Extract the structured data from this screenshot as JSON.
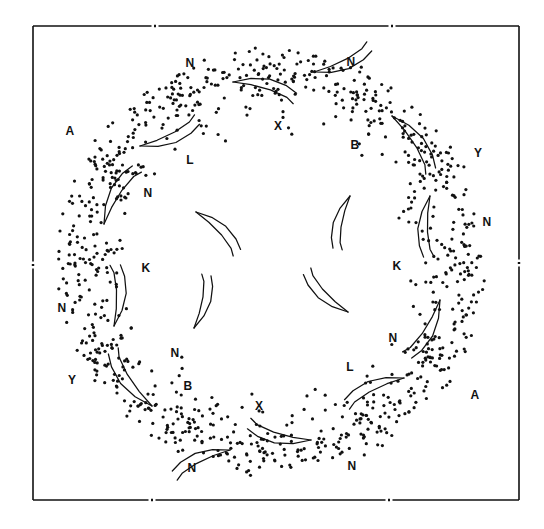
{
  "figure": {
    "domain": "point-pattern-scatter-figure",
    "background_color": "#ffffff",
    "ink_color": "#111111",
    "point_color": "#111111",
    "point_radius_px": 1.6,
    "symmetry": "2-fold rotational (180 degrees) about the ring centre",
    "ring": {
      "center_x": 272,
      "center_y": 262,
      "inner_radius": 100,
      "outer_radius": 215,
      "cluster_count": 12
    }
  },
  "frame": {
    "name": "axis-frame",
    "left": 33,
    "top": 26,
    "right": 519,
    "bottom": 500,
    "stroke_color": "#111111",
    "stroke_width": 1.6,
    "tick_style": "broken-gap tick marks at segment midpoints",
    "ticks": {
      "top": [
        155,
        392
      ],
      "bottom": [
        152,
        389
      ],
      "left": [
        265
      ],
      "right": [
        263
      ]
    },
    "tick_gap_px": 7
  },
  "labels": [
    {
      "id": "lbl-N-top",
      "text": "N",
      "x": 190,
      "y": 63
    },
    {
      "id": "lbl-N-topright",
      "text": "N",
      "x": 351,
      "y": 62
    },
    {
      "id": "lbl-A-left",
      "text": "A",
      "x": 70,
      "y": 131
    },
    {
      "id": "lbl-X-topcenter",
      "text": "X",
      "x": 278,
      "y": 126
    },
    {
      "id": "lbl-B-topright",
      "text": "B",
      "x": 355,
      "y": 145
    },
    {
      "id": "lbl-Y-right",
      "text": "Y",
      "x": 478,
      "y": 153
    },
    {
      "id": "lbl-L-upper",
      "text": "L",
      "x": 190,
      "y": 160
    },
    {
      "id": "lbl-N-upperleft",
      "text": "N",
      "x": 148,
      "y": 193
    },
    {
      "id": "lbl-N-rightupper",
      "text": "N",
      "x": 487,
      "y": 222
    },
    {
      "id": "lbl-K-left",
      "text": "K",
      "x": 146,
      "y": 268
    },
    {
      "id": "lbl-K-right",
      "text": "K",
      "x": 397,
      "y": 266
    },
    {
      "id": "lbl-N-leftmid",
      "text": "N",
      "x": 62,
      "y": 308
    },
    {
      "id": "lbl-N-rightmid",
      "text": "N",
      "x": 393,
      "y": 338
    },
    {
      "id": "lbl-N-lowerleft",
      "text": "N",
      "x": 175,
      "y": 353
    },
    {
      "id": "lbl-L-lower",
      "text": "L",
      "x": 350,
      "y": 367
    },
    {
      "id": "lbl-Y-lowerleft",
      "text": "Y",
      "x": 72,
      "y": 380
    },
    {
      "id": "lbl-B-bottomleft",
      "text": "B",
      "x": 188,
      "y": 386
    },
    {
      "id": "lbl-A-lowerright",
      "text": "A",
      "x": 475,
      "y": 395
    },
    {
      "id": "lbl-X-bottomcenter",
      "text": "X",
      "x": 259,
      "y": 406
    },
    {
      "id": "lbl-N-bottomleft",
      "text": "N",
      "x": 192,
      "y": 468
    },
    {
      "id": "lbl-N-bottomright",
      "text": "N",
      "x": 352,
      "y": 466
    }
  ],
  "clusters": [
    {
      "id": "cluster-1",
      "cx": 272,
      "cy": 74,
      "n": 52,
      "spread": 40,
      "elong": 1.5,
      "angle": 0
    },
    {
      "id": "cluster-2",
      "cx": 366,
      "cy": 98,
      "n": 48,
      "spread": 38,
      "elong": 1.4,
      "angle": 30
    },
    {
      "id": "cluster-3",
      "cx": 437,
      "cy": 166,
      "n": 50,
      "spread": 38,
      "elong": 1.4,
      "angle": 60
    },
    {
      "id": "cluster-4",
      "cx": 462,
      "cy": 262,
      "n": 46,
      "spread": 36,
      "elong": 1.4,
      "angle": 90
    },
    {
      "id": "cluster-5",
      "cx": 437,
      "cy": 358,
      "n": 50,
      "spread": 38,
      "elong": 1.4,
      "angle": 120
    },
    {
      "id": "cluster-6",
      "cx": 366,
      "cy": 426,
      "n": 48,
      "spread": 38,
      "elong": 1.4,
      "angle": 150
    },
    {
      "id": "cluster-7",
      "cx": 272,
      "cy": 450,
      "n": 52,
      "spread": 40,
      "elong": 1.5,
      "angle": 180
    },
    {
      "id": "cluster-8",
      "cx": 178,
      "cy": 426,
      "n": 48,
      "spread": 38,
      "elong": 1.4,
      "angle": 210
    },
    {
      "id": "cluster-9",
      "cx": 107,
      "cy": 358,
      "n": 50,
      "spread": 38,
      "elong": 1.4,
      "angle": 240
    },
    {
      "id": "cluster-10",
      "cx": 82,
      "cy": 262,
      "n": 46,
      "spread": 36,
      "elong": 1.4,
      "angle": 270
    },
    {
      "id": "cluster-11",
      "cx": 107,
      "cy": 166,
      "n": 50,
      "spread": 38,
      "elong": 1.4,
      "angle": 300
    },
    {
      "id": "cluster-12",
      "cx": 178,
      "cy": 98,
      "n": 48,
      "spread": 38,
      "elong": 1.4,
      "angle": 330
    }
  ],
  "hooks": [
    {
      "id": "hook-1",
      "x": 233,
      "y": 82,
      "scale": 1.0,
      "rot": 18,
      "flip": 0
    },
    {
      "id": "hook-2",
      "x": 314,
      "y": 72,
      "scale": 0.95,
      "rot": -28,
      "flip": 1
    },
    {
      "id": "hook-3",
      "x": 392,
      "y": 116,
      "scale": 1.05,
      "rot": 58,
      "flip": 0
    },
    {
      "id": "hook-4",
      "x": 430,
      "y": 196,
      "scale": 0.95,
      "rot": 88,
      "flip": 1
    },
    {
      "id": "hook-5",
      "x": 440,
      "y": 300,
      "scale": 1.0,
      "rot": 124,
      "flip": 0
    },
    {
      "id": "hook-6",
      "x": 404,
      "y": 378,
      "scale": 0.98,
      "rot": 152,
      "flip": 1
    },
    {
      "id": "hook-7",
      "x": 311,
      "y": 440,
      "scale": 1.0,
      "rot": 198,
      "flip": 0
    },
    {
      "id": "hook-8",
      "x": 230,
      "y": 450,
      "scale": 0.95,
      "rot": 152,
      "flip": 1
    },
    {
      "id": "hook-9",
      "x": 152,
      "y": 406,
      "scale": 1.05,
      "rot": 238,
      "flip": 0
    },
    {
      "id": "hook-10",
      "x": 114,
      "y": 326,
      "scale": 0.95,
      "rot": 268,
      "flip": 1
    },
    {
      "id": "hook-11",
      "x": 104,
      "y": 224,
      "scale": 1.0,
      "rot": 304,
      "flip": 0
    },
    {
      "id": "hook-12",
      "x": 140,
      "y": 146,
      "scale": 0.98,
      "rot": 332,
      "flip": 1
    },
    {
      "id": "hook-13",
      "x": 196,
      "y": 212,
      "scale": 0.9,
      "rot": 48,
      "flip": 0
    },
    {
      "id": "hook-14",
      "x": 348,
      "y": 312,
      "scale": 0.9,
      "rot": 228,
      "flip": 0
    },
    {
      "id": "hook-15",
      "x": 350,
      "y": 196,
      "scale": 0.85,
      "rot": 100,
      "flip": 1
    },
    {
      "id": "hook-16",
      "x": 194,
      "y": 328,
      "scale": 0.85,
      "rot": 280,
      "flip": 1
    }
  ]
}
